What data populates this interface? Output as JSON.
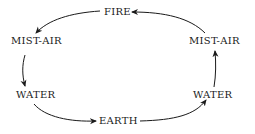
{
  "diagram": {
    "type": "cycle",
    "nodes": {
      "fire": "FIRE",
      "mist_air_left": "MIST-AIR",
      "water_left": "WATER",
      "earth": "EARTH",
      "water_right": "WATER",
      "mist_air_right": "MIST-AIR"
    },
    "edges": [
      {
        "from": "FIRE",
        "to": "MIST-AIR (left)"
      },
      {
        "from": "MIST-AIR (left)",
        "to": "WATER (left)"
      },
      {
        "from": "WATER (left)",
        "to": "EARTH"
      },
      {
        "from": "EARTH",
        "to": "WATER (right)"
      },
      {
        "from": "WATER (right)",
        "to": "MIST-AIR (right)"
      },
      {
        "from": "MIST-AIR (right)",
        "to": "FIRE"
      }
    ],
    "line_color": "#1a1a1a"
  }
}
